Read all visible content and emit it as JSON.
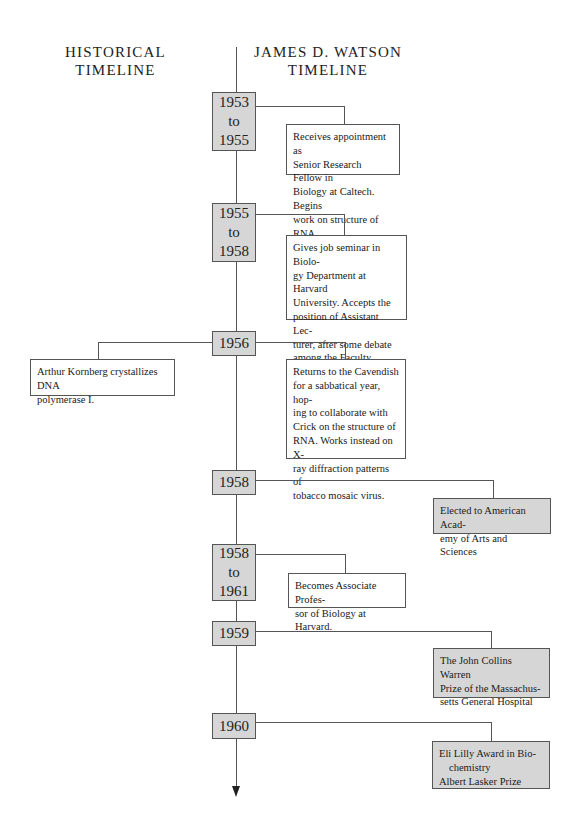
{
  "headings": {
    "historical": [
      "HISTORICAL",
      "TIMELINE"
    ],
    "watson": [
      "JAMES D. WATSON",
      "TIMELINE"
    ]
  },
  "entries": [
    {
      "year": [
        "1953",
        "to",
        "1955"
      ],
      "side": "watson",
      "type": "event",
      "text": "Receives appointment as Senior Research Fellow in Biology at Caltech. Begins work on structure of RNA."
    },
    {
      "year": [
        "1955",
        "to",
        "1958"
      ],
      "side": "watson",
      "type": "event",
      "text": "Gives job seminar in Biology Department at Harvard University. Accepts the position of Assistant Lecturer, after some debate among the Faculty."
    },
    {
      "year": [
        "1956"
      ],
      "side": "both",
      "type": "event",
      "historical_text": "Arthur Kornberg crystallizes DNA polymerase I.",
      "text": "Returns to the Cavendish for a sabbatical year, hoping to collaborate with Crick on the structure of RNA. Works instead on X-ray diffraction patterns of tobacco mosaic virus."
    },
    {
      "year": [
        "1958"
      ],
      "side": "watson",
      "type": "award",
      "text": "Elected to American Academy of Arts and Sciences"
    },
    {
      "year": [
        "1958",
        "to",
        "1961"
      ],
      "side": "watson",
      "type": "event",
      "text": "Becomes Associate Professor of Biology at Harvard."
    },
    {
      "year": [
        "1959"
      ],
      "side": "watson",
      "type": "award",
      "text": "The John Collins Warren Prize of the Massachusetts General Hospital"
    },
    {
      "year": [
        "1960"
      ],
      "side": "watson",
      "type": "award",
      "lines": [
        "Eli Lilly Award in Bio-",
        "chemistry",
        "Albert Lasker Prize"
      ]
    }
  ],
  "display_lines": {
    "e0": [
      "Receives appointment as",
      "Senior Research Fellow in",
      "Biology at Caltech. Begins",
      "work on structure of RNA."
    ],
    "e1": [
      "Gives job seminar in Biolo-",
      "gy Department at Harvard",
      "University. Accepts the",
      "position of Assistant Lec-",
      "turer, after some debate",
      "among the Faculty."
    ],
    "h2": [
      "Arthur Kornberg crystallizes DNA",
      "polymerase I."
    ],
    "e2": [
      "Returns to the Cavendish",
      "for a sabbatical year, hop-",
      "ing to collaborate with",
      "Crick on the structure of",
      "RNA. Works instead on X-",
      "ray diffraction patterns of",
      "tobacco mosaic virus."
    ],
    "e3": [
      "Elected to American Acad-",
      "emy of Arts and Sciences"
    ],
    "e4": [
      "Becomes Associate Profes-",
      "sor of Biology at Harvard."
    ],
    "e5": [
      "The John Collins Warren",
      "Prize of the Massachus-",
      "setts General Hospital"
    ],
    "e6": [
      "Eli Lilly Award in Bio-",
      "chemistry",
      "Albert Lasker Prize"
    ]
  },
  "colors": {
    "year_box_fill": "#d6d6d6",
    "award_box_fill": "#d6d6d6",
    "event_box_fill": "#ffffff",
    "line": "#555555"
  }
}
